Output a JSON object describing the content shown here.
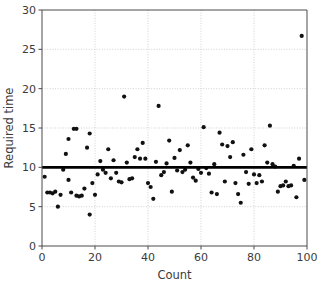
{
  "chart_data": {
    "type": "scatter",
    "title": "",
    "xlabel": "Count",
    "ylabel": "Required time",
    "xlim": [
      0,
      100
    ],
    "ylim": [
      0,
      30
    ],
    "xticks": [
      0,
      20,
      40,
      60,
      80,
      100
    ],
    "yticks": [
      0,
      5,
      10,
      15,
      20,
      25,
      30
    ],
    "grid": true,
    "grid_style": "dotted",
    "grid_color": "#cccccc",
    "legend": "none",
    "marker_color": "#111111",
    "marker_size": 4.2,
    "series": [
      {
        "name": "Required time",
        "x": [
          1,
          2,
          3,
          4,
          5,
          6,
          7,
          8,
          9,
          10,
          10,
          11,
          12,
          13,
          13,
          14,
          15,
          16,
          17,
          18,
          18,
          19,
          20,
          21,
          22,
          23,
          24,
          25,
          26,
          27,
          28,
          29,
          30,
          31,
          32,
          33,
          34,
          35,
          36,
          37,
          38,
          39,
          40,
          41,
          42,
          43,
          44,
          45,
          46,
          47,
          48,
          49,
          50,
          51,
          52,
          53,
          54,
          55,
          56,
          57,
          58,
          59,
          60,
          61,
          62,
          63,
          64,
          65,
          66,
          67,
          68,
          69,
          70,
          71,
          72,
          73,
          74,
          75,
          76,
          77,
          78,
          79,
          80,
          81,
          82,
          83,
          84,
          85,
          86,
          87,
          88,
          89,
          90,
          91,
          92,
          93,
          94,
          95,
          96,
          97,
          98,
          99
        ],
        "y": [
          8.8,
          6.8,
          6.8,
          6.7,
          6.9,
          5.0,
          6.5,
          9.7,
          11.7,
          13.6,
          8.4,
          6.8,
          14.9,
          14.9,
          6.4,
          6.3,
          6.4,
          7.3,
          12.5,
          4.0,
          14.3,
          8.0,
          6.5,
          9.1,
          10.8,
          9.7,
          9.3,
          12.3,
          8.6,
          10.9,
          9.3,
          8.2,
          8.1,
          19.0,
          10.6,
          8.5,
          8.6,
          11.3,
          12.3,
          11.1,
          13.1,
          11.1,
          8.0,
          7.5,
          6.0,
          10.7,
          17.8,
          9.0,
          9.4,
          10.5,
          13.4,
          6.9,
          11.2,
          9.6,
          12.2,
          9.4,
          9.7,
          12.8,
          10.6,
          8.7,
          8.3,
          9.8,
          9.3,
          15.1,
          9.9,
          9.2,
          6.8,
          10.4,
          6.6,
          14.4,
          12.9,
          8.2,
          12.7,
          11.3,
          13.2,
          8.0,
          6.6,
          5.5,
          11.6,
          9.4,
          7.9,
          12.3,
          9.1,
          8.0,
          9.0,
          8.2,
          12.8,
          10.6,
          15.3,
          10.4,
          10.1,
          6.9,
          7.6,
          7.7,
          8.2,
          7.6,
          7.7,
          10.2,
          6.2,
          11.1,
          26.7,
          8.4
        ]
      }
    ],
    "trendline": {
      "type": "horizontal",
      "y": 10.0,
      "x_start": 0,
      "x_end": 100,
      "color": "#000000",
      "width": 2.6
    }
  }
}
